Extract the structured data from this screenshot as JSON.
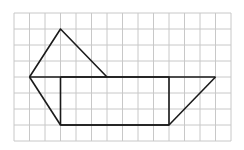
{
  "diagram": {
    "type": "grid-figure",
    "grid": {
      "cols": 14,
      "rows": 8,
      "origin_x": 14,
      "origin_y": 13,
      "cell_w": 15.5,
      "cell_h": 16,
      "line_color": "#c8c8c8"
    },
    "figure_color": "#1a1a1a",
    "shapes": [
      {
        "name": "upper-quadrilateral",
        "points": [
          [
            1,
            4
          ],
          [
            3,
            1
          ],
          [
            6,
            4
          ]
        ]
      },
      {
        "name": "left-triangle-edge",
        "points": [
          [
            1,
            4
          ],
          [
            3,
            7
          ]
        ]
      },
      {
        "name": "rectangle",
        "points": [
          [
            3,
            4
          ],
          [
            10,
            4
          ],
          [
            10,
            7
          ],
          [
            3,
            7
          ]
        ]
      },
      {
        "name": "top-baseline",
        "points": [
          [
            1,
            4
          ],
          [
            13,
            4
          ]
        ]
      },
      {
        "name": "bottom-baseline",
        "points": [
          [
            3,
            7
          ],
          [
            10,
            7
          ]
        ]
      },
      {
        "name": "right-slant-edge",
        "points": [
          [
            10,
            7
          ],
          [
            13,
            4
          ]
        ]
      }
    ]
  }
}
